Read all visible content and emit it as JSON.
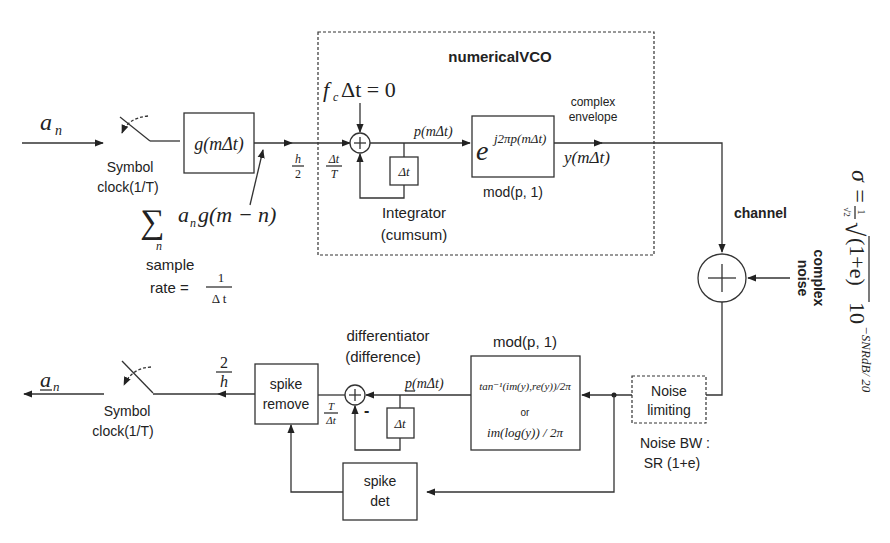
{
  "diagram": {
    "title": "numericalVCO",
    "transmitter": {
      "input_symbol": "a",
      "input_symbol_sub": "n",
      "switch_label_1": "Symbol",
      "switch_label_2": "clock(1/T)",
      "pulse_filter": "g(mΔt)",
      "sum_expr": "a",
      "sum_expr_sub": "n",
      "sum_expr_tail": "g(m − n)",
      "sum_index": "n",
      "sample_label": "sample",
      "rate_label": "rate =",
      "rate_num": "1",
      "rate_den": "Δ t",
      "gain_h_num": "h",
      "gain_h_den": "2",
      "gain_dt_num": "Δt",
      "gain_dt_den": "T"
    },
    "vco": {
      "fc_label": "f",
      "fc_sub": "c",
      "fc_tail": "Δt = 0",
      "integrator_delay": "Δt",
      "integrator_label_1": "Integrator",
      "integrator_label_2": "(cumsum)",
      "phase_signal": "p(mΔt)",
      "exp_base": "e",
      "exp_power": "j2πp(mΔt)",
      "mod_label": "mod(p, 1)",
      "envelope_label_1": "complex",
      "envelope_label_2": "envelope",
      "output_signal": "y(mΔt)"
    },
    "channel": {
      "label": "channel",
      "noise_label_1": "complex",
      "noise_label_2": "noise",
      "sigma_formula": "σ = (1/√2) √((1+e)) 10^(−SNRdB/20)",
      "sigma_lhs": "σ =",
      "sigma_frac_num": "1",
      "sigma_frac_den": "√2",
      "sigma_root": "(1+e)",
      "sigma_ten": "10",
      "sigma_exp": "−SNRdB/ 20"
    },
    "receiver": {
      "noise_limit_1": "Noise",
      "noise_limit_2": "limiting",
      "noise_bw_1": "Noise BW :",
      "noise_bw_2": "SR (1+e)",
      "demod_title": "mod(p, 1)",
      "demod_line_1": "tan⁻¹(im(y),re(y))/2π",
      "demod_or": "or",
      "demod_line_2": "im(log(y)) / 2π",
      "diff_label_1": "differentiator",
      "diff_label_2": "(difference)",
      "diff_signal": "p(mΔt)",
      "diff_delay": "Δt",
      "diff_minus": "-",
      "gain_T_num": "T",
      "gain_T_den": "Δt",
      "spike_remove_1": "spike",
      "spike_remove_2": "remove",
      "spike_det_1": "spike",
      "spike_det_2": "det",
      "gain_2_num": "2",
      "gain_2_den": "h",
      "switch_label_1": "Symbol",
      "switch_label_2": "clock(1/T)",
      "output_symbol": "a",
      "output_symbol_sub": "n"
    }
  }
}
